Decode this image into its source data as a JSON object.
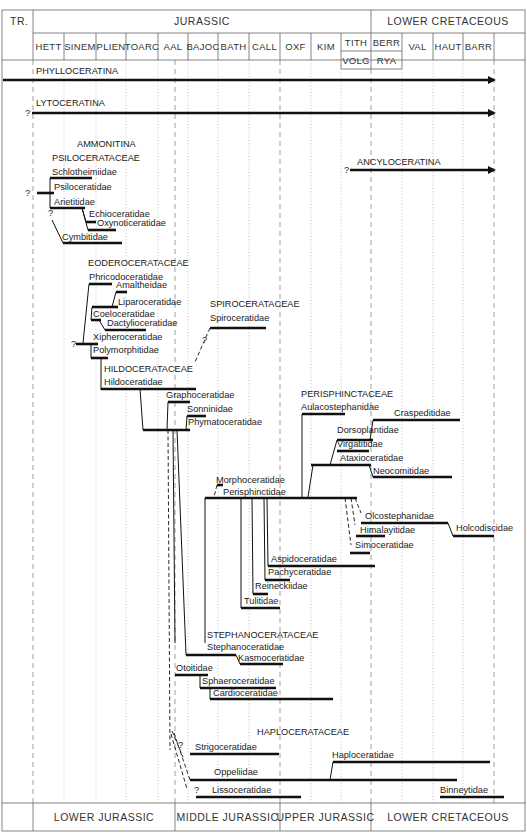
{
  "header": {
    "tr_label": "TR.",
    "jurassic_label": "JURASSIC",
    "cretaceous_label": "LOWER CRETACEOUS",
    "stages": [
      "HETT",
      "SINEM",
      "PLIEN",
      "TOARC",
      "AAL",
      "BAJOC",
      "BATH",
      "CALL",
      "OXF",
      "KIM",
      "TITH",
      "BERR",
      "VAL",
      "HAUT",
      "BARR"
    ],
    "substages": [
      "VOLG",
      "RYA"
    ]
  },
  "footer": {
    "lower_jurassic": "LOWER JURASSIC",
    "middle_jurassic": "MIDDLE JURASSIC",
    "upper_jurassic": "UPPER JURASSIC",
    "lower_cretaceous": "LOWER CRETACEOUS"
  },
  "suborders": {
    "phylloceratina": "PHYLLOCERATINA",
    "lytoceratina": "LYTOCERATINA",
    "ancyloceratina": "ANCYLOCERATINA",
    "ammonitina": "AMMONITINA"
  },
  "superfamilies": {
    "psiloceratacea": "PSILOCERATACEAE",
    "eoderoceratacea": "EODEROCERATACEAE",
    "spiroceratacea": "SPIROCERATACEAE",
    "hildoceratacea": "HILDOCERATACEAE",
    "perisphinctacea": "PERISPHINCTACEAE",
    "stephanoceratacea": "STEPHANOCERATACEAE",
    "haploceratacea": "HAPLOCERATACEAE"
  },
  "families": {
    "schlotheimiidae": "Schlotheimiidae",
    "psiloceratidae": "Psiloceratidae",
    "arietitidae": "Arietitidae",
    "echioceratidae": "Echioceratidae",
    "oxynoticeratidae": "Oxynoticeratidae",
    "cymbitidae": "Cymbitidae",
    "phricodoceratidae": "Phricodoceratidae",
    "amaltheidae": "Amaltheidae",
    "liparoceratidae": "Liparoceratidae",
    "coeloceratidae": "Coeloceratidae",
    "dactylioceratidae": "Dactylioceratidae",
    "xipheroceratidae": "Xipheroceratidae",
    "polymorphitidae": "Polymorphitidae",
    "spiroceratidae": "Spiroceratidae",
    "hildoceratidae": "Hildoceratidae",
    "graphoceratidae": "Graphoceratidae",
    "sonninidae": "Sonninidae",
    "phymatoceratidae": "Phymatoceratidae",
    "aulacostephanidae": "Aulacostephanidae",
    "craspeditidae": "Craspeditidae",
    "dorsoplanitidae": "Dorsoplantidae",
    "virgatitidae": "Virgatitidae",
    "ataxioceratidae": "Ataxioceratidae",
    "neocomitidae": "Neocomitidae",
    "morphoceratidae": "Morphoceratidae",
    "perisphinctidae": "Perisphinctidae",
    "olcostephanidae": "Olcostephanidae",
    "holcodiscidae": "Holcodiscidae",
    "himalayitidae": "Himalayitidae",
    "simoceratidae": "Simoceratidae",
    "aspidoceratidae": "Aspidoceratidae",
    "pachyceratidae": "Pachyceratidae",
    "reineckiidae": "Reineckiidae",
    "tulitidae": "Tulitidae",
    "stephanoceratidae": "Stephanoceratidae",
    "kasmoceratidae": "Kasmoceratidae",
    "otoitidae": "Otoitidae",
    "sphaeroceratidae": "Sphaeroceratidae",
    "cardioceratidae": "Cardioceratidae",
    "strigoceratidae": "Strigoceratidae",
    "haploceratidae": "Haploceratidae",
    "oppeliidae": "Oppeliidae",
    "lissoceratidae": "Lissoceratidae",
    "binneytidae": "Binneytidae"
  },
  "marks": {
    "uncertain": "?"
  }
}
